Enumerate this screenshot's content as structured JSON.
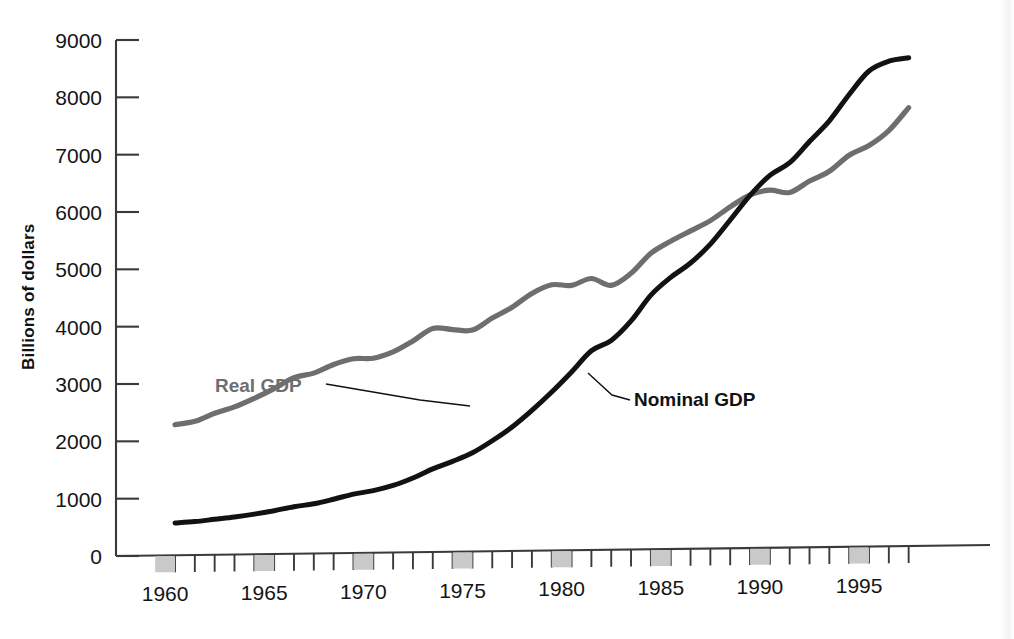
{
  "chart_data": {
    "type": "line",
    "title": "",
    "xlabel": "",
    "ylabel": "Billions of dollars",
    "xlim": [
      1959,
      1998
    ],
    "ylim": [
      0,
      9000
    ],
    "grid": false,
    "legend_position": "inline-annotations",
    "y_ticks": [
      0,
      1000,
      2000,
      3000,
      4000,
      5000,
      6000,
      7000,
      8000,
      9000
    ],
    "y_tick_labels": [
      "0",
      "1000",
      "2000",
      "3000",
      "4000",
      "5000",
      "6000",
      "7000",
      "8000",
      "9000"
    ],
    "x_ticks": [
      1960,
      1961,
      1962,
      1963,
      1964,
      1965,
      1966,
      1967,
      1968,
      1969,
      1970,
      1971,
      1972,
      1973,
      1974,
      1975,
      1976,
      1977,
      1978,
      1979,
      1980,
      1981,
      1982,
      1983,
      1984,
      1985,
      1986,
      1987,
      1988,
      1989,
      1990,
      1991,
      1992,
      1993,
      1994,
      1995,
      1996,
      1997
    ],
    "x_tick_labels": [
      "1960",
      "1965",
      "1970",
      "1975",
      "1980",
      "1985",
      "1990",
      "1995"
    ],
    "x_labeled_years": [
      1960,
      1965,
      1970,
      1975,
      1980,
      1985,
      1990,
      1995
    ],
    "x": [
      1960,
      1961,
      1962,
      1963,
      1964,
      1965,
      1966,
      1967,
      1968,
      1969,
      1970,
      1971,
      1972,
      1973,
      1974,
      1975,
      1976,
      1977,
      1978,
      1979,
      1980,
      1981,
      1982,
      1983,
      1984,
      1985,
      1986,
      1987,
      1988,
      1989,
      1990,
      1991,
      1992,
      1993,
      1994,
      1995,
      1996,
      1997
    ],
    "series": [
      {
        "name": "Real GDP",
        "color": "#6e6e6e",
        "values": [
          2290,
          2350,
          2490,
          2600,
          2750,
          2920,
          3110,
          3190,
          3340,
          3440,
          3450,
          3560,
          3750,
          3970,
          3950,
          3940,
          4150,
          4340,
          4580,
          4730,
          4720,
          4840,
          4720,
          4930,
          5280,
          5490,
          5670,
          5850,
          6090,
          6300,
          6380,
          6340,
          6540,
          6710,
          6990,
          7160,
          7420,
          7820
        ]
      },
      {
        "name": "Nominal GDP",
        "color": "#121212",
        "values": [
          577,
          600,
          640,
          680,
          730,
          790,
          860,
          910,
          990,
          1080,
          1140,
          1230,
          1360,
          1520,
          1650,
          1800,
          2010,
          2250,
          2540,
          2860,
          3210,
          3580,
          3760,
          4100,
          4550,
          4860,
          5110,
          5440,
          5860,
          6290,
          6640,
          6860,
          7230,
          7590,
          8050,
          8460,
          8630,
          8690
        ]
      }
    ],
    "annotations": [
      {
        "text": "Real GDP",
        "target_series": "Real GDP",
        "color": "#6e6e6e"
      },
      {
        "text": "Nominal GDP",
        "target_series": "Nominal GDP",
        "color": "#121212"
      }
    ]
  }
}
